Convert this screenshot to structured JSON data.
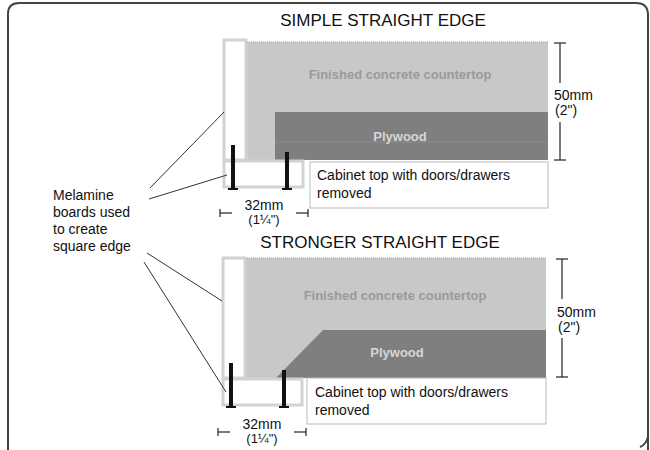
{
  "diagram": {
    "side_label": [
      "Melamine",
      "boards used",
      "to create",
      "square edge"
    ],
    "colors": {
      "frame": "#444444",
      "concrete": "#c8c8c8",
      "concrete_text": "#9a9a9a",
      "plywood": "#7f7f7f",
      "plywood_text": "#d6d6d6",
      "melamine_fill": "#ffffff",
      "melamine_border": "#d2d2d2",
      "screw": "#111111"
    },
    "sections": [
      {
        "title": "SIMPLE STRAIGHT EDGE",
        "concrete_label": "Finished concrete countertop",
        "plywood_label": "Plywood",
        "cabinet_label": [
          "Cabinet top with doors/drawers",
          "removed"
        ],
        "height_dim": [
          "50mm",
          "(2\")"
        ],
        "width_dim": [
          "32mm",
          "(1¼\")"
        ],
        "plywood_edge": "square"
      },
      {
        "title": "STRONGER STRAIGHT EDGE",
        "concrete_label": "Finished concrete countertop",
        "plywood_label": "Plywood",
        "cabinet_label": [
          "Cabinet top with doors/drawers",
          "removed"
        ],
        "height_dim": [
          "50mm",
          "(2\")"
        ],
        "width_dim": [
          "32mm",
          "(1¼\")"
        ],
        "plywood_edge": "chamfered"
      }
    ]
  }
}
